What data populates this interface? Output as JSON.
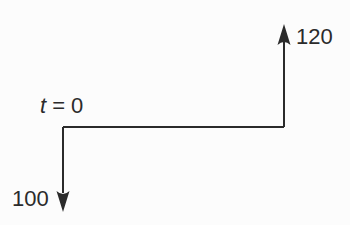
{
  "diagram": {
    "type": "cash-flow-diagram",
    "time_label": {
      "variable": "t",
      "equals_value": "= 0"
    },
    "outflow": {
      "amount": "100",
      "direction": "down",
      "position": "left-end-of-timeline"
    },
    "inflow": {
      "amount": "120",
      "direction": "up",
      "position": "right-end-of-timeline"
    },
    "colors": {
      "line": "#2b2b2b",
      "background": "#fcfcfc"
    }
  }
}
